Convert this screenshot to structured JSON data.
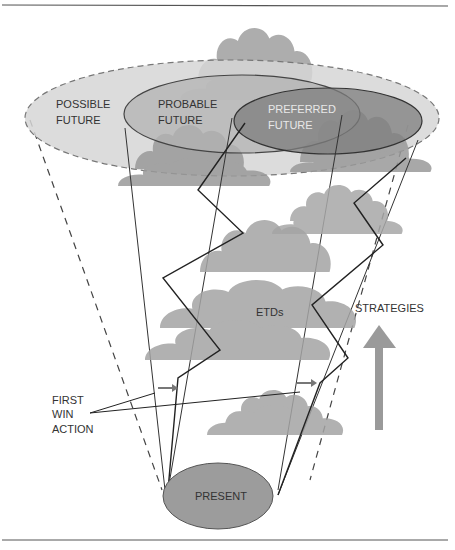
{
  "diagram": {
    "labels": {
      "possible_future_line1": "POSSIBLE",
      "possible_future_line2": "FUTURE",
      "probable_future_line1": "PROBABLE",
      "probable_future_line2": "FUTURE",
      "preferred_future_line1": "PREFERRED",
      "preferred_future_line2": "FUTURE",
      "etds": "ETDs",
      "strategies": "STRATEGIES",
      "first_win_action_line1": "FIRST",
      "first_win_action_line2": "WIN",
      "first_win_action_line3": "ACTION",
      "present": "PRESENT"
    },
    "colors": {
      "possible_fill": "#d9d9d9",
      "probable_fill": "#b8b8b8",
      "preferred_fill": "#8a8a8a",
      "cloud_fill": "#a6a6a6",
      "present_fill": "#9c9c9c",
      "arrow_fill": "#9a9a9a",
      "line": "#333333",
      "rule": "#555555"
    }
  }
}
